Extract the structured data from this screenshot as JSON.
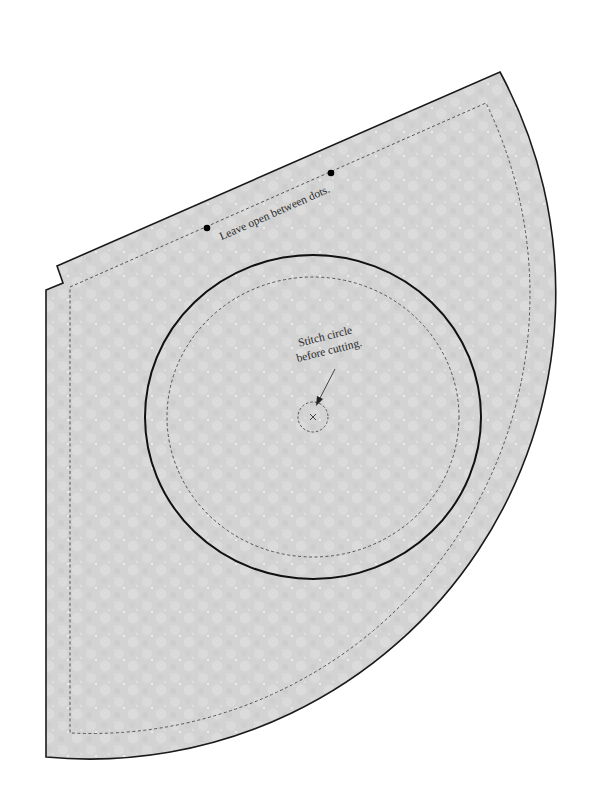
{
  "pattern_piece": {
    "fill_color": "#d3d3d3",
    "texture_light_color": "#dedede",
    "outline_color": "#1a1a1a",
    "seam_color": "#555555",
    "outer_outline": {
      "points": "57,266 500,72 arc(r=466) 46,757 46,290 63,283",
      "arc_center": [
        90,
        293
      ],
      "arc_radius": 466
    },
    "seam_line": {
      "style": "dashed",
      "arc_radius": 439
    },
    "center_circle": {
      "cut_line": {
        "cx": 313,
        "cy": 417,
        "rx": 168,
        "ry": 162,
        "style": "solid"
      },
      "stitch_line": {
        "cx": 313,
        "cy": 417,
        "rx": 146,
        "ry": 140,
        "style": "dashed"
      },
      "center_mark": {
        "cx": 313,
        "cy": 417,
        "r": 15,
        "symbol": "×"
      }
    },
    "dots": [
      {
        "x": 207,
        "y": 228
      },
      {
        "x": 331,
        "y": 173
      }
    ]
  },
  "annotations": {
    "opening_note": "Leave open between dots.",
    "circle_note_line1": "Stitch circle",
    "circle_note_line2": "before cutting.",
    "center_symbol": "×"
  }
}
